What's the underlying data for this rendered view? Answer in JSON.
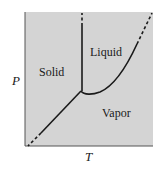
{
  "diagram": {
    "type": "phase-diagram",
    "background_color": "#d4d4d4",
    "line_color": "#1a1a1a",
    "regions": {
      "solid": "Solid",
      "liquid": "Liquid",
      "vapor": "Vapor"
    },
    "axes": {
      "x_label": "T",
      "y_label": "P"
    }
  }
}
